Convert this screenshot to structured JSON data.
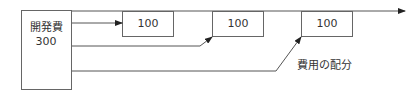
{
  "diagram": {
    "source_box": {
      "title": "開発費",
      "value": "300"
    },
    "allocation_boxes": [
      {
        "value": "100"
      },
      {
        "value": "100"
      },
      {
        "value": "100"
      }
    ],
    "annotation": "費用の配分",
    "colors": {
      "line": "#555555",
      "box_border": "#666666",
      "text": "#333333"
    }
  }
}
